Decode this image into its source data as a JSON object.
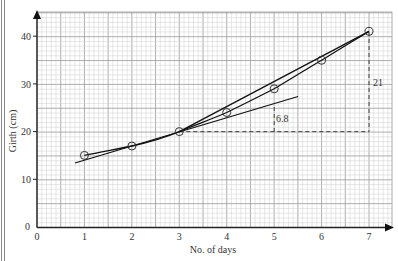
{
  "chart_data": {
    "type": "line",
    "title": "",
    "xlabel": "No. of days",
    "ylabel": "Girth (cm)",
    "xlim": [
      0,
      7.5
    ],
    "ylim": [
      0,
      45
    ],
    "grid": true,
    "x_ticks": [
      "0",
      "1",
      "2",
      "3",
      "4",
      "5",
      "6",
      "7"
    ],
    "y_ticks": [
      "0",
      "10",
      "20",
      "30",
      "40"
    ],
    "series": [
      {
        "name": "Girth",
        "x": [
          1,
          2,
          3,
          4,
          5,
          6,
          7
        ],
        "y": [
          15,
          17,
          20,
          24,
          29,
          35,
          41
        ],
        "marker": "open-circle",
        "style": "smooth-curve"
      },
      {
        "name": "Chord (3,20)-(7,41)",
        "x": [
          3,
          7
        ],
        "y": [
          20,
          41
        ],
        "style": "straight-line"
      },
      {
        "name": "Tangent at day 3",
        "x": [
          0.8,
          5.5
        ],
        "y": [
          13.4,
          27.3
        ],
        "style": "straight-line"
      }
    ],
    "annotations": [
      {
        "text": "21",
        "type": "vertical-dashed",
        "x": 7,
        "y_from": 20,
        "y_to": 41
      },
      {
        "text": "6.8",
        "type": "vertical-dashed",
        "x": 5,
        "y_from": 20,
        "y_to": 24.3
      },
      {
        "text": "",
        "type": "horizontal-dashed",
        "y": 20,
        "x_from": 3,
        "x_to": 7
      }
    ]
  },
  "labels": {
    "xlabel": "No. of days",
    "ylabel": "Girth (cm)",
    "x0": "0",
    "x1": "1",
    "x2": "2",
    "x3": "3",
    "x4": "4",
    "x5": "5",
    "x6": "6",
    "x7": "7",
    "y0": "0",
    "y10": "10",
    "y20": "20",
    "y30": "30",
    "y40": "40",
    "annot_21": "21",
    "annot_68": "6.8"
  },
  "colors": {
    "grid_minor": "#cfcfcf",
    "grid_major": "#9a9a9a",
    "axis": "#222222",
    "line": "#1a1a1a"
  }
}
